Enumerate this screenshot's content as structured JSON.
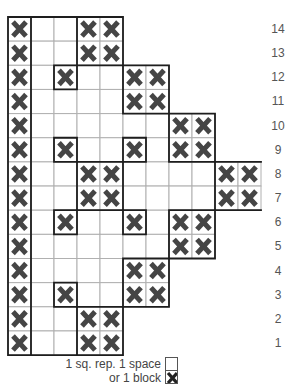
{
  "chart_data": {
    "type": "table",
    "title": "",
    "columns": 11,
    "rows": [
      {
        "number": 14,
        "extent": 5,
        "blocks": [
          1,
          4,
          5
        ]
      },
      {
        "number": 13,
        "extent": 5,
        "blocks": [
          1,
          4,
          5
        ]
      },
      {
        "number": 12,
        "extent": 7,
        "blocks": [
          1,
          3,
          6,
          7
        ]
      },
      {
        "number": 11,
        "extent": 7,
        "blocks": [
          1,
          6,
          7
        ]
      },
      {
        "number": 10,
        "extent": 9,
        "blocks": [
          1,
          8,
          9
        ]
      },
      {
        "number": 9,
        "extent": 9,
        "blocks": [
          1,
          3,
          6,
          8,
          9
        ]
      },
      {
        "number": 8,
        "extent": 11,
        "blocks": [
          1,
          4,
          5,
          10,
          11
        ]
      },
      {
        "number": 7,
        "extent": 11,
        "blocks": [
          1,
          4,
          5,
          10,
          11
        ]
      },
      {
        "number": 6,
        "extent": 9,
        "blocks": [
          1,
          3,
          6,
          8,
          9
        ]
      },
      {
        "number": 5,
        "extent": 9,
        "blocks": [
          1,
          8,
          9
        ]
      },
      {
        "number": 4,
        "extent": 7,
        "blocks": [
          1,
          6,
          7
        ]
      },
      {
        "number": 3,
        "extent": 7,
        "blocks": [
          1,
          3,
          6,
          7
        ]
      },
      {
        "number": 2,
        "extent": 5,
        "blocks": [
          1,
          4,
          5
        ]
      },
      {
        "number": 1,
        "extent": 5,
        "blocks": [
          1,
          4,
          5
        ]
      }
    ],
    "legend": {
      "line1": "1 sq. rep. 1 space",
      "line2": "or 1 block"
    }
  },
  "colors": {
    "x_mark": "#454545",
    "grid_line": "#b0b0b0",
    "outline": "#1e1e1e",
    "row_number": "#555555"
  },
  "legend": {
    "line1": "1 sq. rep. 1 space",
    "line2": "or 1 block"
  }
}
